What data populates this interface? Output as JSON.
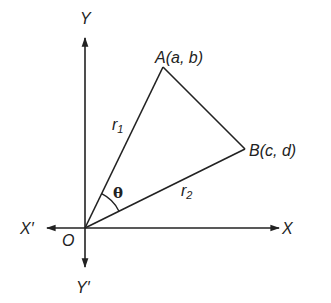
{
  "diagram": {
    "type": "coordinate-geometry-triangle",
    "colors": {
      "line": "#222222",
      "background": "#ffffff"
    },
    "axes": {
      "y_positive_label": "Y",
      "y_negative_label": "Y′",
      "x_positive_label": "X",
      "x_negative_label": "X′",
      "origin_label": "O"
    },
    "points": {
      "A": {
        "name": "A",
        "coords": "(a, b)",
        "label": "A(a, b)"
      },
      "B": {
        "name": "B",
        "coords": "(c, d)",
        "label": "B(c, d)"
      },
      "O": {
        "name": "O"
      }
    },
    "segments": {
      "OA": {
        "label_main": "r",
        "label_sub": "1"
      },
      "OB": {
        "label_main": "r",
        "label_sub": "2"
      },
      "AB": {}
    },
    "angle": {
      "label": "θ",
      "between": "OA and OB"
    }
  }
}
